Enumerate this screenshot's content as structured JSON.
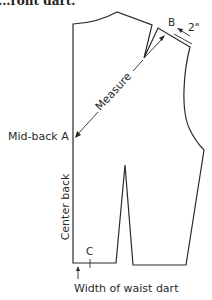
{
  "header": {
    "caption_fragment": "...ront dart."
  },
  "diagram": {
    "labels": {
      "point_b": "B",
      "shoulder_measure": "2\"",
      "measure": "Measure",
      "mid_back": "Mid-back A",
      "center_back": "Center back",
      "point_c": "C",
      "waist_dart_width": "Width of waist dart"
    },
    "colors": {
      "line": "#2a2a2a",
      "background": "#ffffff"
    }
  }
}
